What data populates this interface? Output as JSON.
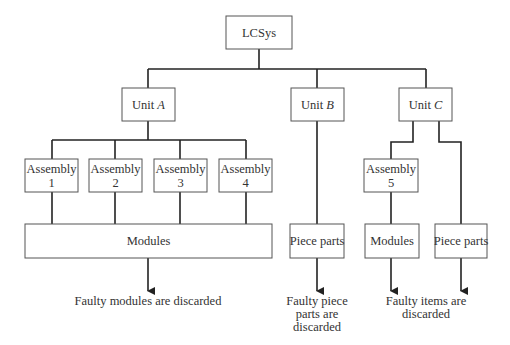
{
  "diagram": {
    "root": {
      "label": "LCSys"
    },
    "units": [
      {
        "prefix": "Unit ",
        "letter": "A"
      },
      {
        "prefix": "Unit ",
        "letter": "B"
      },
      {
        "prefix": "Unit ",
        "letter": "C"
      }
    ],
    "assemblies": [
      {
        "line1": "Assembly",
        "line2": "1"
      },
      {
        "line1": "Assembly",
        "line2": "2"
      },
      {
        "line1": "Assembly",
        "line2": "3"
      },
      {
        "line1": "Assembly",
        "line2": "4"
      },
      {
        "line1": "Assembly",
        "line2": "5"
      }
    ],
    "bottom_boxes": {
      "unit_a_modules": "Modules",
      "unit_b_piece_parts": "Piece parts",
      "unit_c_modules": "Modules",
      "unit_c_piece_parts": "Piece parts"
    },
    "outcomes": {
      "unit_a": [
        "Faulty modules are discarded"
      ],
      "unit_b": [
        "Faulty piece",
        "parts are",
        "discarded"
      ],
      "unit_c": [
        "Faulty items are",
        "discarded"
      ]
    }
  }
}
